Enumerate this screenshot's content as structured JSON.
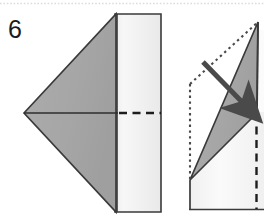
{
  "figure": {
    "kind": "origami-fold-instruction-diagram",
    "step_number": "6",
    "background_color": "#ffffff",
    "scan_artifact": {
      "name": "top-scan-line",
      "color": "#d8d8d8",
      "y": 3
    }
  },
  "colors": {
    "paper_shaded": "#a8a8a8",
    "paper_shaded_dark": "#9a9a9a",
    "paper_white": "#f2f2f2",
    "paper_white_bright": "#fafafa",
    "outline": "#3a3a3a",
    "fold_dashed": "#1d1d1d",
    "hidden_dotted": "#4a4a4a",
    "arrow": "#4a4a4a",
    "step_label": "#1c1c1c"
  },
  "left_figure": {
    "name": "folded-model-front-view",
    "shaded_triangle": {
      "label": "shaded-face",
      "points": "24,113 115,14 115,212"
    },
    "shaded_body": {
      "label": "shaded-body-panel",
      "points": "115,14 160,14 160,212 115,212"
    },
    "white_panel": {
      "label": "white-flap-panel",
      "points": "119,14 160,14 160,212 119,212"
    },
    "center_solid_line": {
      "label": "center-solid-edge",
      "from": "24,113",
      "to": "119,113"
    },
    "center_dashed_line": {
      "label": "center-fold-dashed-line",
      "from": "119,113",
      "to": "161,113"
    },
    "vertical_fold_line": {
      "label": "vertical-fold-edge",
      "x": 119,
      "y1": 14,
      "y2": 212
    }
  },
  "right_figure": {
    "name": "folded-model-side-view",
    "apex": "258,22",
    "shaded_triangle": {
      "label": "shaded-flap-triangle",
      "points": "258,22 256,112 190,180"
    },
    "white_lower": {
      "label": "white-lower-body",
      "points": "190,180 256,112 264,112 264,209 190,209"
    },
    "dotted_vertical": {
      "label": "hidden-vertical-edge",
      "x": 190,
      "y1": 84,
      "y2": 180
    },
    "dotted_diagonal": {
      "label": "hidden-diagonal-edge",
      "from": "190,84",
      "to": "258,22"
    },
    "dashed_vertical": {
      "label": "fold-dashed-vertical-edge",
      "x": 256,
      "y1": 112,
      "y2": 209
    },
    "bottom_edge": {
      "label": "bottom-solid-edge",
      "y": 209,
      "x1": 190,
      "x2": 264
    },
    "left_edge": {
      "label": "left-solid-edge",
      "x": 190,
      "y1": 180,
      "y2": 209
    },
    "right_edge": {
      "label": "right-solid-edge",
      "x": 258,
      "y1": 22,
      "y2": 112
    }
  },
  "arrow": {
    "name": "fold-direction-arrow",
    "from": "203,62",
    "to": "250,110",
    "color": "#4a4a4a",
    "shaft_width": 5,
    "head_length": 17,
    "head_width": 15
  }
}
